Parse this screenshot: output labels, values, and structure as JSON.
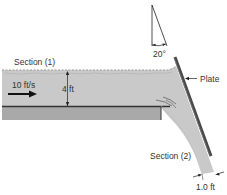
{
  "diagram": {
    "labels": {
      "section1": "Section (1)",
      "velocity": "10 ft/s",
      "depth": "4 ft",
      "angle": "20°",
      "plate": "Plate",
      "section2": "Section (2)",
      "jet_width": "1.0 ft"
    },
    "colors": {
      "water": "#c8c8c8",
      "floor": "#a8a8a8",
      "plate": "#555555",
      "line": "#222222"
    }
  }
}
